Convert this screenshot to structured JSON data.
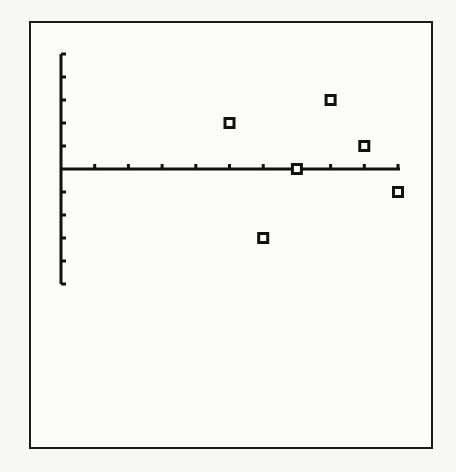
{
  "chart_data": {
    "type": "scatter",
    "title": "",
    "xlabel": "",
    "ylabel": "",
    "grid": false,
    "legend": null,
    "marker": "hollow-square",
    "x_tick_step": 1,
    "y_tick_step": 1,
    "xlim": [
      0,
      10
    ],
    "ylim": [
      -5,
      5
    ],
    "x_ticks": [
      1,
      2,
      3,
      4,
      5,
      6,
      7,
      8,
      9,
      10
    ],
    "y_ticks": [
      -5,
      -4,
      -3,
      -2,
      -1,
      1,
      2,
      3,
      4,
      5
    ],
    "points": [
      {
        "x": 5,
        "y": 2
      },
      {
        "x": 6,
        "y": -3
      },
      {
        "x": 7,
        "y": 0
      },
      {
        "x": 8,
        "y": 3
      },
      {
        "x": 9,
        "y": 1
      },
      {
        "x": 10,
        "y": -1
      }
    ]
  },
  "style": {
    "axis_color": "#111111",
    "marker_color": "#111111",
    "frame_color": "#1a1a1a",
    "background": "#fbfbf9"
  }
}
